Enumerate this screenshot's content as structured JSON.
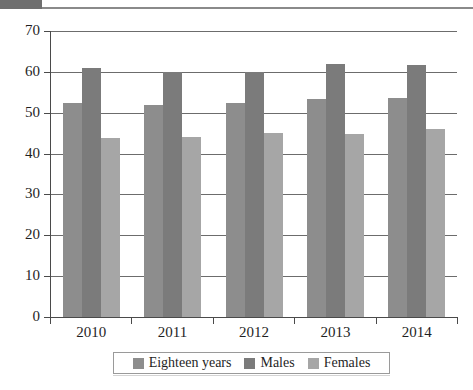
{
  "page": {
    "header_block_label": "scan-artifact-block",
    "header_rule_label": "scan-artifact-rule"
  },
  "chart_data": {
    "type": "bar",
    "title": "",
    "subtitle": "",
    "xlabel": "",
    "ylabel": "",
    "categories": [
      "2010",
      "2011",
      "2012",
      "2013",
      "2014"
    ],
    "series": [
      {
        "name": "Eighteen years",
        "color": "#8d8d8d",
        "values": [
          52.3,
          52.0,
          52.3,
          53.4,
          53.6
        ]
      },
      {
        "name": "Males",
        "color": "#7b7b7b",
        "values": [
          60.9,
          60.0,
          60.0,
          61.9,
          61.6
        ]
      },
      {
        "name": "Females",
        "color": "#a6a6a6",
        "values": [
          43.8,
          44.1,
          45.0,
          44.9,
          46.1
        ]
      }
    ],
    "ylim": [
      0,
      70
    ],
    "ytick_step": 10,
    "yticks": [
      0,
      10,
      20,
      30,
      40,
      50,
      60,
      70
    ],
    "ytick_labels": [
      "0",
      "10",
      "20",
      "30",
      "40",
      "50",
      "60",
      "70"
    ],
    "grid": true,
    "grid_axis": "y",
    "legend_position": "bottom",
    "legend_entries": [
      "Eighteen years",
      "Males",
      "Females"
    ]
  }
}
